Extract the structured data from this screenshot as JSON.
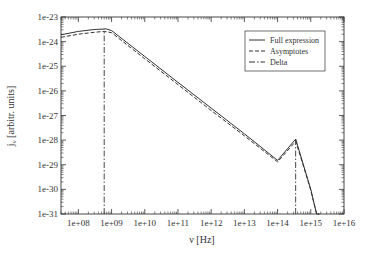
{
  "chart_data": {
    "type": "line",
    "title": "",
    "xlabel": "ν [Hz]",
    "ylabel": "j_ν [arbitr. units]",
    "xscale": "log",
    "yscale": "log",
    "xlim": [
      30000000.0,
      1e+16
    ],
    "ylim": [
      1e-31,
      1e-23
    ],
    "xticks": [
      "1e+08",
      "1e+09",
      "1e+10",
      "1e+11",
      "1e+12",
      "1e+13",
      "1e+14",
      "1e+15",
      "1e+16"
    ],
    "yticks": [
      "1e-23",
      "1e-24",
      "1e-25",
      "1e-26",
      "1e-27",
      "1e-28",
      "1e-29",
      "1e-30",
      "1e-31"
    ],
    "grid": false,
    "legend_position": "upper right",
    "series": [
      {
        "name": "Full expression",
        "style": "solid",
        "x": [
          30000000.0,
          100000000.0,
          300000000.0,
          700000000.0,
          1000000000.0,
          10000000000.0,
          100000000000.0,
          1000000000000.0,
          10000000000000.0,
          100000000000000.0,
          350000000000000.0,
          600000000000000.0,
          1000000000000000.0,
          1500000000000000.0,
          1800000000000000.0
        ],
        "y": [
          1.9e-24,
          2.6e-24,
          3.1e-24,
          3.3e-24,
          2.8e-24,
          2.5e-25,
          2.2e-26,
          2e-27,
          1.8e-28,
          1.5e-29,
          1.1e-28,
          1e-29,
          1e-30,
          1e-31,
          1e-31
        ]
      },
      {
        "name": "Asymptotes",
        "style": "dashed",
        "x": [
          30000000.0,
          100000000.0,
          300000000.0,
          600000000.0,
          1000000000.0,
          10000000000.0,
          100000000000.0,
          1000000000000.0,
          10000000000000.0,
          100000000000000.0,
          350000000000000.0,
          600000000000000.0,
          1000000000000000.0,
          1500000000000000.0,
          1800000000000000.0
        ],
        "y": [
          1.5e-24,
          2e-24,
          2.4e-24,
          2.6e-24,
          2.3e-24,
          2e-25,
          1.8e-26,
          1.6e-27,
          1.5e-28,
          1.3e-29,
          9e-29,
          9e-30,
          9e-31,
          1e-31,
          1e-31
        ]
      },
      {
        "name": "Delta",
        "style": "dash-dot",
        "x": [
          600000000.0,
          600000000.0,
          350000000000000.0,
          350000000000000.0
        ],
        "y": [
          1e-31,
          3.1e-24,
          1e-31,
          1.1e-28
        ]
      }
    ]
  }
}
